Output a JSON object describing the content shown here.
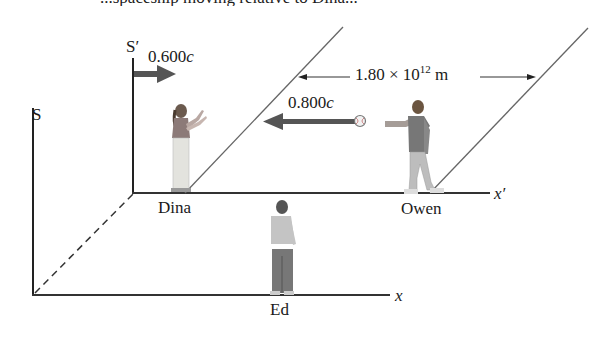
{
  "figure": {
    "caption_fragment": "...spaceship moving relative to Dina...",
    "frames": {
      "S": {
        "label": "S",
        "axis_label": "x"
      },
      "S_prime": {
        "label": "S′",
        "axis_label": "x′",
        "velocity_label": "0.600c",
        "velocity_value": "0.600",
        "velocity_unit": "c"
      }
    },
    "ball": {
      "velocity_value": "0.800",
      "velocity_unit": "c",
      "direction": "left"
    },
    "distance": {
      "mantissa": "1.80 × 10",
      "exponent": "12",
      "unit": " m"
    },
    "people": [
      {
        "name": "Dina",
        "frame": "S′"
      },
      {
        "name": "Owen",
        "frame": "S′"
      },
      {
        "name": "Ed",
        "frame": "S"
      }
    ],
    "colors": {
      "axis": "#222222",
      "arrow": "#555555",
      "diagonal": "#666666"
    }
  }
}
